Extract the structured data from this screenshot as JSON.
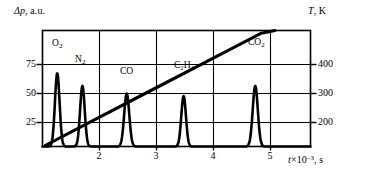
{
  "figure": {
    "y_axis_left": {
      "label_symbol": "Δp",
      "label_units": ", a.u.",
      "ticks": [
        {
          "value": 75,
          "text": "75",
          "y_px": 64
        },
        {
          "value": 50,
          "text": "50",
          "y_px": 93
        },
        {
          "value": 25,
          "text": "25",
          "y_px": 122
        }
      ]
    },
    "y_axis_right": {
      "label_symbol": "T",
      "label_units": ", K",
      "ticks": [
        {
          "value": 400,
          "text": "400",
          "y_px": 64
        },
        {
          "value": 300,
          "text": "300",
          "y_px": 93
        },
        {
          "value": 200,
          "text": "200",
          "y_px": 122
        }
      ]
    },
    "x_axis": {
      "label_symbol": "t",
      "label_mult": "×10",
      "label_exp": "–3",
      "label_units": ", s",
      "ticks": [
        {
          "value": 2,
          "text": "2",
          "x_px": 99
        },
        {
          "value": 3,
          "text": "3",
          "x_px": 156
        },
        {
          "value": 4,
          "text": "4",
          "x_px": 213
        },
        {
          "value": 5,
          "text": "5",
          "x_px": 270
        }
      ]
    },
    "peak_labels": [
      {
        "name": "O2",
        "formula_main": "O",
        "formula_sub": "2",
        "x_px": 52,
        "y_px": 45
      },
      {
        "name": "N2",
        "formula_main": "N",
        "formula_sub": "2",
        "x_px": 76,
        "y_px": 61
      },
      {
        "name": "CO",
        "formula_main": "CO",
        "formula_sub": "",
        "x_px": 122,
        "y_px": 72
      },
      {
        "name": "C2H4",
        "formula_main": "C₂H₄",
        "formula_sub": "",
        "x_px": 175,
        "y_px": 66
      },
      {
        "name": "CO2",
        "formula_main": "CO",
        "formula_sub": "2",
        "x_px": 249,
        "y_px": 44
      }
    ]
  },
  "chart_data": {
    "type": "line",
    "title": "",
    "xlabel": "t×10⁻³, s",
    "ylabel": "Δp, a.u.",
    "y2label": "T, K",
    "xlim": [
      1.0,
      5.9
    ],
    "ylim": [
      0,
      92
    ],
    "y2lim": [
      119,
      466
    ],
    "grid": true,
    "legend": "none",
    "xticks": [
      2,
      3,
      4,
      5
    ],
    "yticks": [
      25,
      50,
      75
    ],
    "y2ticks": [
      200,
      300,
      400
    ],
    "series": [
      {
        "name": "Δp desorption peaks",
        "type": "line",
        "units": "a.u.",
        "peaks": [
          {
            "species": "O2",
            "center_t": 1.27,
            "height_dp": 58,
            "fwhm_t": 0.1
          },
          {
            "species": "N2",
            "center_t": 1.73,
            "height_dp": 48,
            "fwhm_t": 0.1
          },
          {
            "species": "CO",
            "center_t": 2.54,
            "height_dp": 42,
            "fwhm_t": 0.11
          },
          {
            "species": "C2H4",
            "center_t": 3.58,
            "height_dp": 40,
            "fwhm_t": 0.1
          },
          {
            "species": "CO2",
            "center_t": 4.89,
            "height_dp": 48,
            "fwhm_t": 0.11
          }
        ],
        "baseline_dp": 0
      },
      {
        "name": "Temperature ramp",
        "type": "line",
        "units": "K",
        "points_t_K": [
          [
            1.05,
            122
          ],
          [
            2.0,
            203
          ],
          [
            3.0,
            288
          ],
          [
            4.0,
            373
          ],
          [
            5.0,
            458
          ],
          [
            5.25,
            466
          ]
        ]
      }
    ]
  },
  "colors": {
    "ink": "#000000",
    "background": "#ffffff",
    "grid": "#1a1a1a"
  }
}
